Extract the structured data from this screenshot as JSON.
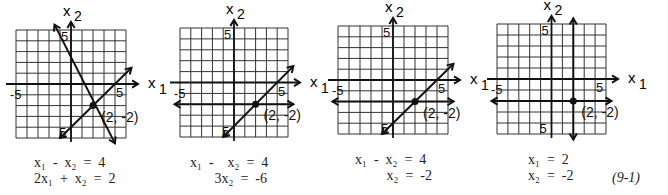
{
  "figure_label": "(9-1)",
  "axis_labels": {
    "x": "x",
    "x_sub": "1",
    "y": "x",
    "y_sub": "2"
  },
  "tick_labels": {
    "neg": "-5",
    "pos": "5"
  },
  "point_label": "(2,  -2)",
  "panels": [
    {
      "name": "panel-1",
      "grid": {
        "left": 16,
        "top": 30,
        "right": 126,
        "bottom": 138
      },
      "lines": [
        {
          "x1": -1.5,
          "y1": 5.5,
          "x2": 4.0,
          "y2": -5.5,
          "arrows": "both"
        },
        {
          "x1": -1.0,
          "y1": -5.0,
          "x2": 5.5,
          "y2": 1.5,
          "arrows": "both"
        }
      ],
      "axis_arrow_y": true,
      "equations": [
        {
          "lines": [
            "x₁  -  x₂  =  4",
            "2x₁  +  x₂  =  2"
          ]
        }
      ],
      "eq_pos": {
        "left": 34,
        "top": 155
      }
    },
    {
      "name": "panel-2",
      "grid": {
        "left": 180,
        "top": 28,
        "right": 288,
        "bottom": 137
      },
      "lines": [
        {
          "x1": -1.0,
          "y1": -5.0,
          "x2": 5.5,
          "y2": 1.5,
          "arrows": "both"
        },
        {
          "x1": -5.5,
          "y1": -2.0,
          "x2": 5.5,
          "y2": -2.0,
          "arrows": "both"
        }
      ],
      "equations": [
        {
          "lines": [
            "x₁  -    x₂  =  4",
            "       3x₂  =  -6"
          ]
        }
      ],
      "eq_pos": {
        "left": 190,
        "top": 155
      }
    },
    {
      "name": "panel-3",
      "grid": {
        "left": 338,
        "top": 26,
        "right": 448,
        "bottom": 134
      },
      "lines": [
        {
          "x1": -1.0,
          "y1": -5.0,
          "x2": 5.5,
          "y2": 1.5,
          "arrows": "both"
        },
        {
          "x1": -5.5,
          "y1": -2.0,
          "x2": 5.5,
          "y2": -2.0,
          "arrows": "both"
        }
      ],
      "equations": [
        {
          "lines": [
            "x₁  -  x₂  =  4",
            "         x₂  =  -2"
          ]
        }
      ],
      "eq_pos": {
        "left": 355,
        "top": 152
      }
    },
    {
      "name": "panel-4",
      "grid": {
        "left": 497,
        "top": 24,
        "right": 606,
        "bottom": 134
      },
      "lines": [
        {
          "x1": 2.0,
          "y1": 5.5,
          "x2": 2.0,
          "y2": -5.5,
          "arrows": "both"
        },
        {
          "x1": -5.5,
          "y1": -2.0,
          "x2": 5.5,
          "y2": -2.0,
          "arrows": "both"
        }
      ],
      "equations": [
        {
          "lines": [
            "x₁  =  2",
            "x₂  =  -2"
          ]
        }
      ],
      "eq_pos": {
        "left": 528,
        "top": 152
      }
    }
  ],
  "chart_data": {
    "type": "line",
    "xlabel": "x1",
    "ylabel": "x2",
    "xlim": [
      -5,
      5
    ],
    "ylim": [
      -5,
      5
    ],
    "grid": true,
    "solution": [
      2,
      -2
    ],
    "systems": [
      {
        "equations": [
          "x1 - x2 = 4",
          "2x1 + x2 = 2"
        ]
      },
      {
        "equations": [
          "x1 - x2 = 4",
          "3x2 = -6"
        ]
      },
      {
        "equations": [
          "x1 - x2 = 4",
          "x2 = -2"
        ]
      },
      {
        "equations": [
          "x1 = 2",
          "x2 = -2"
        ]
      }
    ],
    "annotation": "(2, -2)",
    "figure_number": "(9-1)"
  }
}
